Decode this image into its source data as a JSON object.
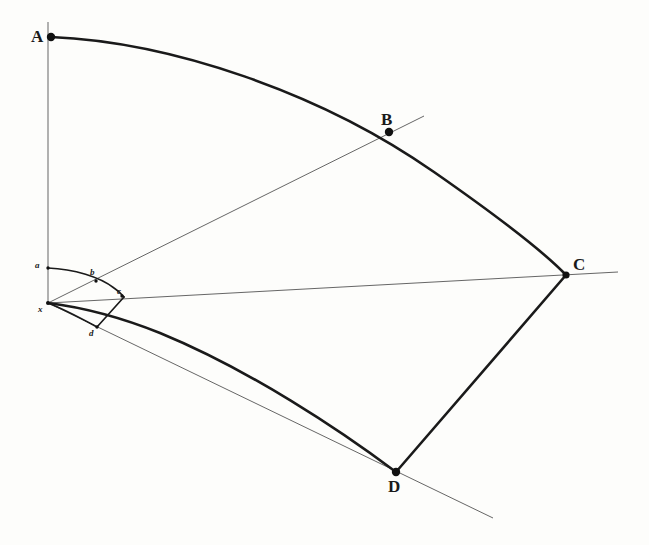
{
  "figure": {
    "background_color": "#fdfdfb",
    "ink_color": "#1a1a1a",
    "thin_line_color": "#4a4a4a",
    "width": 649,
    "height": 545
  },
  "major_points": [
    {
      "id": "A",
      "label": "A",
      "x": 51,
      "y": 37,
      "label_x": 31,
      "label_y": 28
    },
    {
      "id": "B",
      "label": "B",
      "x": 389,
      "y": 132,
      "label_x": 381,
      "label_y": 113
    },
    {
      "id": "C",
      "label": "C",
      "x": 566,
      "y": 275,
      "label_x": 576,
      "label_y": 258
    },
    {
      "id": "D",
      "label": "D",
      "x": 396,
      "y": 472,
      "label_x": 388,
      "label_y": 479
    }
  ],
  "minor_points": [
    {
      "id": "a",
      "label": "a",
      "x": 48,
      "y": 268,
      "label_x": 35,
      "label_y": 263
    },
    {
      "id": "b",
      "label": "b",
      "x": 96,
      "y": 280,
      "label_x": 90,
      "label_y": 268
    },
    {
      "id": "c",
      "label": "c",
      "x": 122,
      "y": 297,
      "label_x": 117,
      "label_y": 288
    },
    {
      "id": "d",
      "label": "d",
      "x": 97,
      "y": 326,
      "label_x": 89,
      "label_y": 327
    }
  ],
  "apex": {
    "id": "apex",
    "label": "x",
    "x": 48,
    "y": 303,
    "label_x": 38,
    "label_y": 306
  },
  "curves": {
    "outer_arc_A_to_C": "M 51,37 C 240,50 440,150 566,275",
    "chord_C_to_D": "M 566,275 L 396,472",
    "lower_arc_D_to_apex": "M 396,472 C 300,420 150,350 48,303",
    "inner_arc_a_to_c": "M 48,268 C 80,268 110,280 122,297",
    "inner_chord_c_to_d": "M 122,297 L 97,326",
    "inner_arc_d_to_apex": "M 97,326 C 80,320 60,310 48,303"
  },
  "rays": {
    "vertical_through_A": {
      "x1": 48,
      "y1": 22,
      "x2": 48,
      "y2": 303
    },
    "through_B": {
      "x1": 48,
      "y1": 303,
      "x2": 424,
      "y2": 116
    },
    "through_C": {
      "x1": 48,
      "y1": 303,
      "x2": 618,
      "y2": 272
    },
    "through_D": {
      "x1": 48,
      "y1": 303,
      "x2": 493,
      "y2": 518
    }
  },
  "stroke_widths": {
    "thick": 2.6,
    "thin": 0.8,
    "inner_thick": 1.5,
    "dot_radius_major": 4.2,
    "dot_radius_minor": 1.6
  }
}
